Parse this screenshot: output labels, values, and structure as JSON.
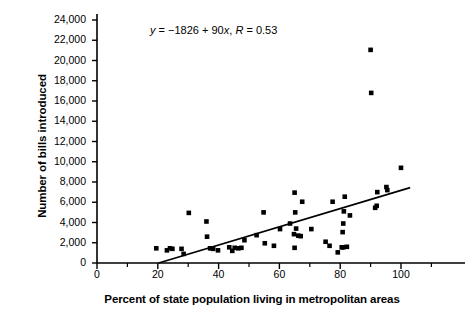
{
  "chart_data": {
    "type": "scatter",
    "title": "",
    "xlabel": "Percent of state population living in metropolitan areas",
    "ylabel": "Number of bills introduced",
    "xlim": [
      0,
      114
    ],
    "ylim": [
      0,
      24000
    ],
    "grid": false,
    "legend": null,
    "annotations": [
      {
        "name": "regression-equation",
        "text": "y = −1826 + 90x, R = 0.53",
        "parts": {
          "y": "y",
          "eq1": " = ",
          "intercept": "−1826",
          "plus": " + ",
          "slope": "90",
          "x": "x",
          "comma": ", ",
          "r": "R",
          "eq2": " = ",
          "rvalue": "0.53"
        }
      }
    ],
    "xticks": [
      0,
      20,
      40,
      60,
      80,
      100
    ],
    "xtick_labels": [
      "0",
      "20",
      "40",
      "60",
      "80",
      "100"
    ],
    "xminor_ticks": [
      10,
      30,
      50,
      70,
      90,
      110
    ],
    "yticks": [
      0,
      2000,
      4000,
      6000,
      8000,
      10000,
      12000,
      14000,
      16000,
      18000,
      20000,
      22000,
      24000
    ],
    "ytick_labels": [
      "0",
      "2,000",
      "4,000",
      "6,000",
      "8,000",
      "10,000",
      "12,000",
      "14,000",
      "16,000",
      "18,000",
      "20,000",
      "22,000",
      "24,000"
    ],
    "series": [
      {
        "name": "states",
        "marker": "square",
        "color": "#000000",
        "points": [
          [
            19.5,
            1450
          ],
          [
            23.0,
            1250
          ],
          [
            24.0,
            1450
          ],
          [
            24.8,
            1400
          ],
          [
            27.8,
            1400
          ],
          [
            28.5,
            900
          ],
          [
            30.2,
            4950
          ],
          [
            36.0,
            4100
          ],
          [
            36.2,
            2600
          ],
          [
            37.2,
            1450
          ],
          [
            38.2,
            1400
          ],
          [
            39.8,
            1250
          ],
          [
            43.5,
            1550
          ],
          [
            44.5,
            1200
          ],
          [
            45.3,
            1500
          ],
          [
            46.5,
            1450
          ],
          [
            47.5,
            1500
          ],
          [
            48.5,
            2250
          ],
          [
            52.5,
            2750
          ],
          [
            54.8,
            5000
          ],
          [
            55.2,
            1950
          ],
          [
            58.2,
            1700
          ],
          [
            60.2,
            3350
          ],
          [
            63.5,
            3900
          ],
          [
            64.8,
            2850
          ],
          [
            65.0,
            6950
          ],
          [
            65.2,
            5000
          ],
          [
            65.5,
            3400
          ],
          [
            66.2,
            2700
          ],
          [
            67.0,
            2650
          ],
          [
            65.0,
            1500
          ],
          [
            67.5,
            6050
          ],
          [
            70.5,
            3350
          ],
          [
            75.2,
            2100
          ],
          [
            76.5,
            1700
          ],
          [
            77.5,
            6050
          ],
          [
            79.2,
            1050
          ],
          [
            80.5,
            1550
          ],
          [
            81.0,
            1550
          ],
          [
            82.2,
            1600
          ],
          [
            80.8,
            3050
          ],
          [
            81.0,
            3900
          ],
          [
            81.2,
            5100
          ],
          [
            81.5,
            6550
          ],
          [
            83.2,
            4700
          ],
          [
            90.0,
            21050
          ],
          [
            90.2,
            16800
          ],
          [
            91.5,
            5450
          ],
          [
            92.0,
            5650
          ],
          [
            92.2,
            7000
          ],
          [
            95.2,
            7500
          ],
          [
            95.5,
            7200
          ],
          [
            100.0,
            9400
          ]
        ]
      }
    ],
    "fit_line": {
      "name": "regression-line",
      "equation": "y = -1826 + 90x",
      "intercept": -1826,
      "slope": 90,
      "r": 0.53,
      "x_start": 20.3,
      "x_end": 103.0
    }
  }
}
